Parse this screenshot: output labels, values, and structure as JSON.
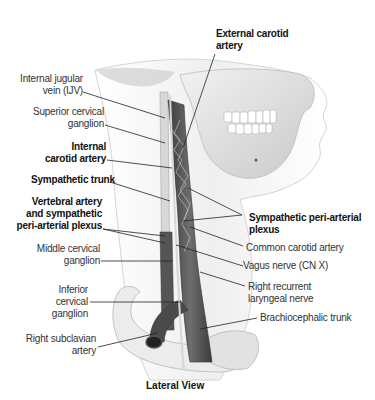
{
  "figure": {
    "view_caption": "Lateral View",
    "colors": {
      "background": "#ffffff",
      "skin_outline": "#d9d9d9",
      "bone": "#e6e6e6",
      "vessel_dark": "#4a4a4a",
      "vessel_mid": "#6b6b6b",
      "nerve": "#d0d0d0",
      "leader_line": "#222222",
      "label_text": "#333333"
    },
    "labels_left": [
      {
        "id": "ijv",
        "line1": "Internal jugular",
        "line2": "vein (IJV)",
        "bold": false
      },
      {
        "id": "sup-cervical-ganglion",
        "line1": "Superior cervical",
        "line2": "ganglion",
        "bold": false
      },
      {
        "id": "internal-carotid",
        "line1": "Internal",
        "line2": "carotid artery",
        "bold": true
      },
      {
        "id": "sympathetic-trunk",
        "line1": "Sympathetic trunk",
        "bold": true
      },
      {
        "id": "vertebral-artery",
        "line1": "Vertebral artery",
        "line2": "and sympathetic",
        "line3": "peri-arterial plexus",
        "bold": true
      },
      {
        "id": "middle-cervical-ganglion",
        "line1": "Middle cervical",
        "line2": "ganglion",
        "bold": false
      },
      {
        "id": "inferior-cervical-ganglion",
        "line1": "Inferior",
        "line2": "cervical",
        "line3": "ganglion",
        "bold": false
      },
      {
        "id": "right-subclavian",
        "line1": "Right subclavian",
        "line2": "artery",
        "bold": false
      }
    ],
    "labels_right": [
      {
        "id": "external-carotid",
        "line1": "External carotid",
        "line2": "artery",
        "bold": true
      },
      {
        "id": "sympathetic-plexus",
        "line1": "Sympathetic peri-arterial",
        "line2": "plexus",
        "bold": true
      },
      {
        "id": "common-carotid",
        "line1": "Common carotid artery",
        "bold": false
      },
      {
        "id": "vagus",
        "line1": "Vagus nerve (CN X)",
        "bold": false
      },
      {
        "id": "recurrent-laryngeal",
        "line1": "Right recurrent",
        "line2": "laryngeal nerve",
        "bold": false
      },
      {
        "id": "brachiocephalic",
        "line1": "Brachiocephalic trunk",
        "bold": false
      }
    ]
  }
}
